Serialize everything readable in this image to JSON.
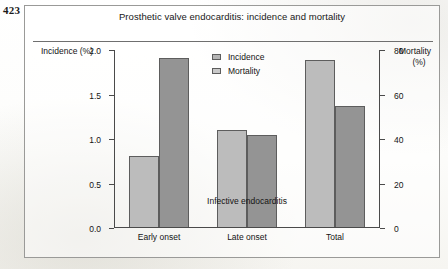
{
  "page_number": "423",
  "figure": {
    "title": "Prosthetic valve endocarditis: incidence and mortality"
  },
  "axes": {
    "left_label": "Incidence",
    "left_unit": "(%)",
    "right_label": "Mortality",
    "right_unit": "(%)",
    "x_title": "Infective endocarditis",
    "left_ticks": [
      "0.0",
      "0.5",
      "1.0",
      "1.5",
      "2.0"
    ],
    "right_ticks": [
      "0",
      "20",
      "40",
      "60",
      "80"
    ]
  },
  "legend": {
    "items": [
      {
        "label": "Incidence",
        "color": "#b5b5b5",
        "swatch": "legend-swatch-incidence"
      },
      {
        "label": "Mortality",
        "color": "#c9c9c9",
        "swatch": "legend-swatch-mortality"
      }
    ]
  },
  "chart_data": {
    "type": "bar",
    "title": "Prosthetic valve endocarditis: incidence and mortality",
    "xlabel": "Infective endocarditis",
    "ylabel": "Incidence (%)",
    "y2label": "Mortality (%)",
    "categories": [
      "Early onset",
      "Late onset",
      "Total"
    ],
    "series": [
      {
        "name": "Incidence",
        "axis": "left",
        "unit": "%",
        "color": "#bcbcbc",
        "values": [
          0.8,
          1.09,
          1.88
        ]
      },
      {
        "name": "Mortality",
        "axis": "right",
        "unit": "%",
        "color": "#949494",
        "values": [
          76,
          41.5,
          54.5
        ]
      }
    ],
    "ylim": [
      0.0,
      2.0
    ],
    "y2lim": [
      0,
      80
    ],
    "ytick_step": 0.5,
    "y2tick_step": 20,
    "grid": false,
    "legend_position": "inside-top-center"
  }
}
